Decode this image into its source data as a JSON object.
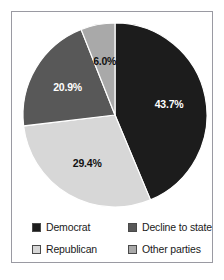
{
  "chart_data": {
    "type": "pie",
    "title": "",
    "subtitle": "",
    "xlabel": "",
    "ylabel": "",
    "grid": false,
    "legend_position": "bottom",
    "start_angle_deg": 0,
    "direction": "clockwise",
    "categories": [
      "Democrat",
      "Republican",
      "Decline to state",
      "Other parties"
    ],
    "values": [
      43.7,
      29.4,
      20.9,
      6.0
    ],
    "data_labels": [
      "43.7%",
      "29.4%",
      "20.9%",
      "6.0%"
    ],
    "slices": [
      {
        "label": "Democrat",
        "value": 43.7,
        "data_label": "43.7%",
        "color": "#1c1c1c",
        "label_color": "#ffffff"
      },
      {
        "label": "Republican",
        "value": 29.4,
        "data_label": "29.4%",
        "color": "#d7d7d7",
        "label_color": "#111111"
      },
      {
        "label": "Decline to state",
        "value": 20.9,
        "data_label": "20.9%",
        "color": "#585858",
        "label_color": "#ffffff"
      },
      {
        "label": "Other parties",
        "value": 6.0,
        "data_label": "6.0%",
        "color": "#a9a9a9",
        "label_color": "#111111"
      }
    ]
  },
  "legend": {
    "items": [
      {
        "label": "Democrat",
        "color": "#1c1c1c"
      },
      {
        "label": "Decline to state",
        "color": "#585858"
      },
      {
        "label": "Republican",
        "color": "#d7d7d7"
      },
      {
        "label": "Other parties",
        "color": "#a9a9a9"
      }
    ]
  },
  "frame": {
    "border_color": "#9a9aa2",
    "background": "#ffffff"
  }
}
